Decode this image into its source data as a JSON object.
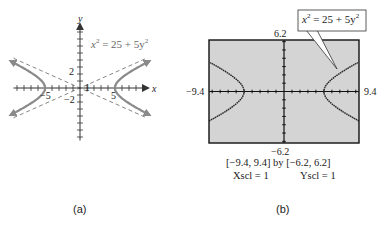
{
  "chart_data": [
    {
      "type": "line",
      "panel": "a",
      "title": "x^2 = 25 + 5y^2",
      "xlabel": "x",
      "ylabel": "y",
      "equation": "x^2 = 25 + 5y^2",
      "xlim": [
        -9.5,
        9.5
      ],
      "ylim": [
        -7.5,
        9
      ],
      "tick_labels": {
        "x": [
          "-5",
          "1",
          "5"
        ],
        "y": [
          "2",
          "-2"
        ]
      },
      "vertices": [
        [
          -5,
          0
        ],
        [
          5,
          0
        ]
      ],
      "asymptotes": [
        "y = x/sqrt(5)",
        "y = -x/sqrt(5)"
      ],
      "series": [
        {
          "name": "right branch",
          "style": "solid-arrow"
        },
        {
          "name": "left branch",
          "style": "solid-arrow"
        },
        {
          "name": "asymptotes",
          "style": "dashed"
        }
      ],
      "grid": false
    },
    {
      "type": "line",
      "panel": "b",
      "title": "x^2 = 25 + 5y^2",
      "window": {
        "xmin": -9.4,
        "xmax": 9.4,
        "ymin": -6.2,
        "ymax": 6.2,
        "xscl": 1,
        "yscl": 1
      },
      "equation": "x^2 = 25 + 5y^2",
      "vertices": [
        [
          -5,
          0
        ],
        [
          5,
          0
        ]
      ],
      "grid": false
    }
  ],
  "panel_a": {
    "axis_x_label": "x",
    "axis_y_label": "y",
    "equation_label": {
      "lhs": "x",
      "rhs": " = 25 + 5y"
    },
    "tick_labels": {
      "x_neg5": "−5",
      "x_1": "1",
      "x_5": "5",
      "y_2": "2",
      "y_neg2": "−2"
    },
    "caption": "(a)"
  },
  "panel_b": {
    "callout": {
      "lhs": "x",
      "rhs": " = 25 + 5y"
    },
    "ymax_label": "6.2",
    "ymin_label": "−6.2",
    "xmin_label": "−9.4",
    "xmax_label": "9.4",
    "window_line": "[−9.4, 9.4]  by  [−6.2, 6.2]",
    "xscl": "Xscl = 1",
    "yscl": "Yscl = 1",
    "caption": "(b)"
  },
  "colors": {
    "curve_a": "#8a8a8a",
    "axis": "#333333",
    "screen_bg": "#d4d4d4",
    "plot": "#222222"
  }
}
